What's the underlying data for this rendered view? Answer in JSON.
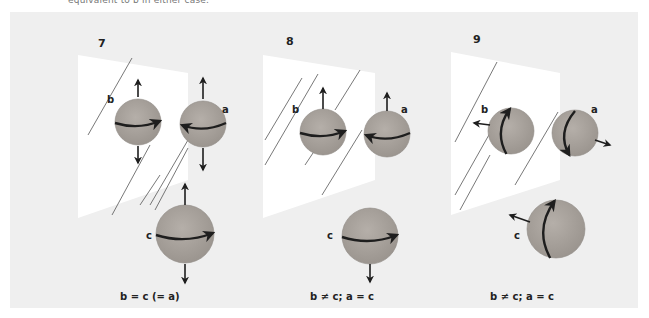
{
  "header": {
    "caption": "equivalent to b in either case."
  },
  "colors": {
    "background": "#efefef",
    "plane": "#ffffff",
    "sphere": "#a8a29c",
    "sphere_edge": "#8f8a85",
    "ink": "#1e1e1e"
  },
  "panels": [
    {
      "number": "7",
      "caption": "b = c (= a)",
      "plane": [
        [
          78,
          55
        ],
        [
          188,
          73
        ],
        [
          188,
          180
        ],
        [
          78,
          218
        ]
      ],
      "hatch": [
        [
          [
            88,
            135
          ],
          [
            132,
            58
          ]
        ],
        [
          [
            112,
            215
          ],
          [
            150,
            145
          ]
        ],
        [
          [
            140,
            205
          ],
          [
            160,
            175
          ]
        ],
        [
          [
            150,
            205
          ],
          [
            188,
            140
          ]
        ],
        [
          [
            155,
            210
          ],
          [
            188,
            148
          ]
        ]
      ],
      "spheres": [
        {
          "name": "b",
          "cx": 138,
          "cy": 122,
          "r": 23,
          "label": [
            107,
            103
          ],
          "spin": "equator-right",
          "arrows": [
            [
              138,
              97,
              138,
              80
            ],
            [
              138,
              146,
              138,
              163
            ]
          ]
        },
        {
          "name": "a",
          "cx": 203,
          "cy": 124,
          "r": 23,
          "label": [
            222,
            113
          ],
          "spin": "equator-left",
          "arrows": [
            [
              203,
              99,
              203,
              78
            ],
            [
              203,
              148,
              203,
              170
            ]
          ]
        },
        {
          "name": "c",
          "cx": 185,
          "cy": 234,
          "r": 29,
          "label": [
            146,
            239
          ],
          "spin": "equator-right",
          "arrows": [
            [
              185,
              205,
              185,
              184
            ],
            [
              185,
              264,
              185,
              283
            ]
          ]
        }
      ]
    },
    {
      "number": "8",
      "caption": "b ≠ c; a = c",
      "plane": [
        [
          263,
          55
        ],
        [
          375,
          73
        ],
        [
          375,
          180
        ],
        [
          263,
          218
        ]
      ],
      "hatch": [
        [
          [
            265,
            140
          ],
          [
            302,
            78
          ]
        ],
        [
          [
            265,
            165
          ],
          [
            318,
            74
          ]
        ],
        [
          [
            335,
            110
          ],
          [
            360,
            70
          ]
        ],
        [
          [
            305,
            165
          ],
          [
            315,
            150
          ]
        ],
        [
          [
            322,
            195
          ],
          [
            362,
            130
          ]
        ]
      ],
      "spheres": [
        {
          "name": "b",
          "cx": 323,
          "cy": 132,
          "r": 23,
          "label": [
            292,
            113
          ],
          "spin": "equator-right",
          "arrows": [
            [
              323,
              109,
              323,
              88
            ]
          ]
        },
        {
          "name": "a",
          "cx": 387,
          "cy": 134,
          "r": 23,
          "label": [
            401,
            113
          ],
          "spin": "equator-left",
          "arrows": [
            [
              387,
              111,
              387,
              93
            ]
          ]
        },
        {
          "name": "c",
          "cx": 370,
          "cy": 236,
          "r": 28,
          "label": [
            327,
            239
          ],
          "spin": "equator-right",
          "arrows": [
            [
              370,
              264,
              370,
              282
            ]
          ]
        }
      ]
    },
    {
      "number": "9",
      "caption": "b ≠ c; a = c",
      "plane": [
        [
          451,
          52
        ],
        [
          560,
          73
        ],
        [
          560,
          180
        ],
        [
          451,
          215
        ]
      ],
      "hatch": [
        [
          [
            455,
            142
          ],
          [
            497,
            62
          ]
        ],
        [
          [
            455,
            195
          ],
          [
            490,
            133
          ]
        ],
        [
          [
            460,
            210
          ],
          [
            490,
            155
          ]
        ],
        [
          [
            515,
            185
          ],
          [
            558,
            112
          ]
        ]
      ],
      "spheres": [
        {
          "name": "b",
          "cx": 511,
          "cy": 131,
          "r": 23,
          "label": [
            481,
            113
          ],
          "spin": "meridian-up",
          "arrows": [
            [
              490,
              125,
              474,
              123
            ]
          ]
        },
        {
          "name": "a",
          "cx": 575,
          "cy": 133,
          "r": 23,
          "label": [
            591,
            113
          ],
          "spin": "meridian-down",
          "arrows": [
            [
              595,
              140,
              610,
              145
            ]
          ]
        },
        {
          "name": "c",
          "cx": 556,
          "cy": 229,
          "r": 29,
          "label": [
            514,
            239
          ],
          "spin": "meridian-up",
          "arrows": [
            [
              530,
              222,
              510,
              215
            ]
          ]
        }
      ]
    }
  ],
  "caption_positions": [
    [
      120,
      300
    ],
    [
      310,
      300
    ],
    [
      490,
      300
    ]
  ],
  "number_positions": [
    [
      98,
      47
    ],
    [
      286,
      45
    ],
    [
      473,
      43
    ]
  ]
}
